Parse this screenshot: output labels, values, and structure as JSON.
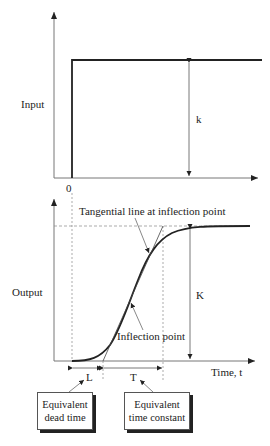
{
  "top_plot": {
    "ylabel": "Input",
    "origin_label": "0",
    "magnitude_label": "k"
  },
  "bottom_plot": {
    "ylabel": "Output",
    "xlabel": "Time, t",
    "magnitude_label": "K",
    "tangent_annotation": "Tangential line at inflection point",
    "inflection_annotation": "Inflection point",
    "dead_time_label": "L",
    "time_constant_label": "T"
  },
  "callouts": {
    "dead_time": {
      "line1": "Equivalent",
      "line2": "dead time"
    },
    "time_constant": {
      "line1": "Equivalent",
      "line2": "time constant"
    }
  },
  "colors": {
    "line": "#222222",
    "dashed": "#888888",
    "background": "#ffffff"
  }
}
